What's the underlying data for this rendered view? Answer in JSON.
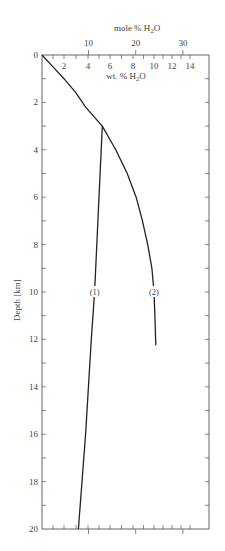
{
  "chart_data": {
    "type": "line",
    "title": "",
    "top_axis_label": "mole % H2O",
    "top_axis_ticks": [
      10,
      20,
      30
    ],
    "xlabel": "wt. % H2O",
    "xticks": [
      2,
      4,
      6,
      8,
      10,
      12,
      14
    ],
    "xlim": [
      0,
      15
    ],
    "ylabel": "Depth [km]",
    "yticks": [
      0,
      2,
      4,
      6,
      8,
      10,
      12,
      14,
      16,
      18,
      20
    ],
    "ylim": [
      0,
      20
    ],
    "y_inverted": true,
    "grid": false,
    "series": [
      {
        "name": "(1)",
        "label_at_depth_km": 10,
        "points": [
          [
            5.3,
            3
          ],
          [
            5.0,
            6
          ],
          [
            4.6,
            10
          ],
          [
            4.3,
            12
          ],
          [
            3.8,
            16
          ],
          [
            3.5,
            18
          ],
          [
            3.2,
            20
          ]
        ]
      },
      {
        "name": "(2)",
        "label_at_depth_km": 10,
        "points": [
          [
            0,
            0
          ],
          [
            1.0,
            0.5
          ],
          [
            2.0,
            1.0
          ],
          [
            3.0,
            1.6
          ],
          [
            3.8,
            2.2
          ],
          [
            5.3,
            3
          ],
          [
            6.5,
            4
          ],
          [
            7.5,
            5
          ],
          [
            8.3,
            6
          ],
          [
            8.9,
            7
          ],
          [
            9.4,
            8
          ],
          [
            9.8,
            9
          ],
          [
            10.0,
            10
          ],
          [
            10.1,
            11
          ],
          [
            10.2,
            12.25
          ]
        ]
      }
    ]
  }
}
